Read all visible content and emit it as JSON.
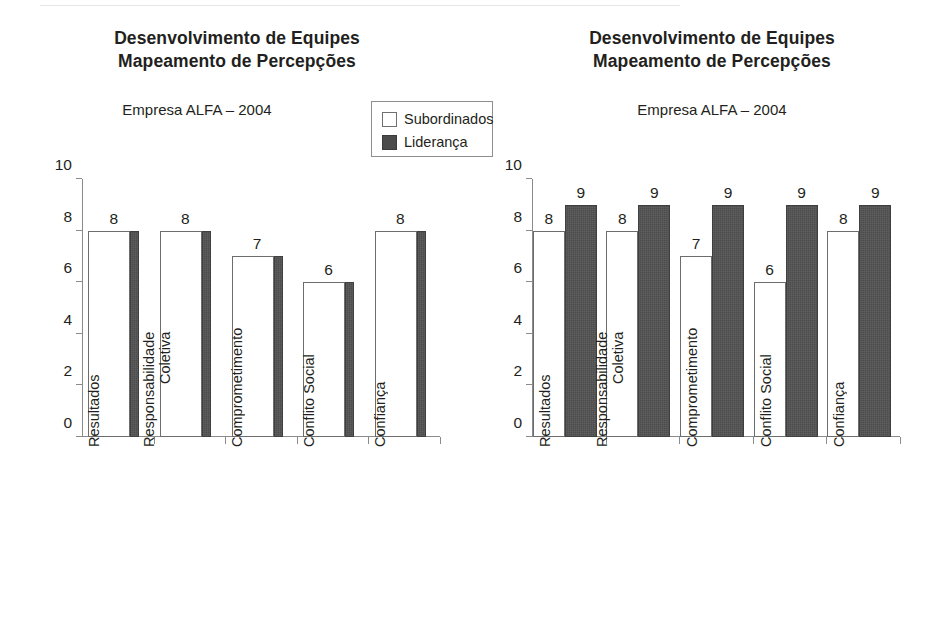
{
  "document": {
    "background": "#ffffff",
    "ink": "#231f20"
  },
  "colors": {
    "subordinados": "#ffffff",
    "lideranca": "#4c4c4c",
    "axis": "#8b8b8b",
    "outline": "#6d6d6d"
  },
  "legend": {
    "items": [
      {
        "label": "Subordinados",
        "swatch": "white"
      },
      {
        "label": "Liderança",
        "swatch": "dark"
      }
    ]
  },
  "charts": [
    {
      "id": "chart-left",
      "title_line1": "Desenvolvimento de Equipes",
      "title_line2": "Mapeamento de Percepções",
      "subtitle": "Empresa ALFA – 2004",
      "has_legend": true
    },
    {
      "id": "chart-right",
      "title_line1": "Desenvolvimento de Equipes",
      "title_line2": "Mapeamento de Percepções",
      "subtitle": "Empresa ALFA – 2004",
      "has_legend": false
    }
  ],
  "chart_data": [
    {
      "type": "bar",
      "title": "Desenvolvimento de Equipes Mapeamento de Percepções",
      "subtitle": "Empresa ALFA – 2004",
      "xlabel": "",
      "ylabel": "",
      "ylim": [
        0,
        10
      ],
      "yticks": [
        0,
        2,
        4,
        6,
        8,
        10
      ],
      "grid": false,
      "legend": [
        "Subordinados",
        "Liderança"
      ],
      "legend_position": "top-right",
      "categories": [
        "Resultados",
        "Responsabilidade\nColetiva",
        "Comprometimento",
        "Conflito Social",
        "Confiança"
      ],
      "series": [
        {
          "name": "Subordinados",
          "values": [
            8,
            8,
            7,
            6,
            8
          ]
        },
        {
          "name": "Liderança",
          "values": [
            8,
            8,
            7,
            6,
            8
          ]
        }
      ],
      "data_labels": [
        "8",
        "8",
        "7",
        "6",
        "8"
      ]
    },
    {
      "type": "bar",
      "title": "Desenvolvimento de Equipes Mapeamento de Percepções",
      "subtitle": "Empresa ALFA – 2004",
      "xlabel": "",
      "ylabel": "",
      "ylim": [
        0,
        10
      ],
      "yticks": [
        0,
        2,
        4,
        6,
        8,
        10
      ],
      "grid": false,
      "legend": [
        "Subordinados",
        "Liderança"
      ],
      "legend_position": "none",
      "categories": [
        "Resultados",
        "Responsabilidade\nColetiva",
        "Comprometimento",
        "Conflito Social",
        "Confiança"
      ],
      "series": [
        {
          "name": "Subordinados",
          "values": [
            8,
            8,
            7,
            6,
            8
          ]
        },
        {
          "name": "Liderança",
          "values": [
            9,
            9,
            9,
            9,
            9
          ]
        }
      ],
      "data_labels_subordinados": [
        "8",
        "8",
        "7",
        "6",
        "8"
      ],
      "data_labels_lideranca": [
        "9",
        "9",
        "9",
        "9",
        "9"
      ]
    }
  ],
  "axis": {
    "tick_labels": [
      "0",
      "2",
      "4",
      "6",
      "8",
      "10"
    ]
  }
}
